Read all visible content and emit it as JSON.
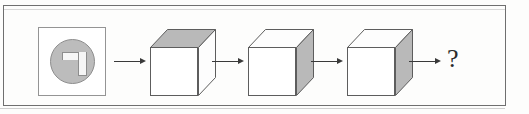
{
  "figure": {
    "type": "visual-sequence-puzzle",
    "caption": "",
    "question_mark": "?",
    "panel": {
      "icon_name": "gamma-corner-shape",
      "circle_fill": "#bcbcbc",
      "shape_fill": "#f6f6f6",
      "border_color": "#949494"
    },
    "arrows": [
      {
        "label": "",
        "direction": "right"
      },
      {
        "label": "",
        "direction": "right"
      },
      {
        "label": "",
        "direction": "right"
      },
      {
        "label": "",
        "direction": "right"
      }
    ],
    "cubes": [
      {
        "name": "cube-1",
        "shaded_face": "top",
        "front_fill": "#ffffff",
        "shade_fill": "#b9b9b9"
      },
      {
        "name": "cube-2",
        "shaded_face": "right",
        "front_fill": "#ffffff",
        "shade_fill": "#b9b9b9"
      },
      {
        "name": "cube-3",
        "shaded_face": "right",
        "front_fill": "#ffffff",
        "shade_fill": "#b9b9b9"
      }
    ],
    "frame_color": "#6f6f6f",
    "background": "#fdfdfc"
  },
  "bleed_through": {
    "line_1": "",
    "line_2": ""
  }
}
